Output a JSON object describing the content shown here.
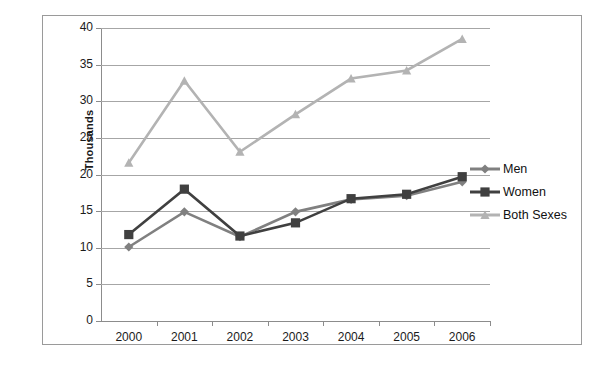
{
  "chart_data": {
    "type": "line",
    "title": "",
    "xlabel": "",
    "ylabel": "Thousands",
    "categories": [
      "2000",
      "2001",
      "2002",
      "2003",
      "2004",
      "2005",
      "2006"
    ],
    "ylim": [
      0,
      40
    ],
    "y_ticks": [
      "0",
      "5",
      "10",
      "15",
      "20",
      "25",
      "30",
      "35",
      "40"
    ],
    "grid": true,
    "legend_position": "right",
    "series": [
      {
        "name": "Men",
        "color": "#808080",
        "marker": "diamond",
        "values": [
          10.1,
          14.9,
          11.5,
          14.9,
          16.6,
          17.1,
          19.0
        ]
      },
      {
        "name": "Women",
        "color": "#404040",
        "marker": "square",
        "values": [
          11.8,
          18.0,
          11.6,
          13.4,
          16.7,
          17.3,
          19.7
        ]
      },
      {
        "name": "Both Sexes",
        "color": "#b3b3b3",
        "marker": "triangle",
        "values": [
          21.6,
          32.8,
          23.1,
          28.2,
          33.1,
          34.2,
          38.5
        ]
      }
    ]
  },
  "legend": {
    "entries": [
      {
        "label": "Men"
      },
      {
        "label": "Women"
      },
      {
        "label": "Both Sexes"
      }
    ]
  },
  "axis": {
    "y_title": "Thousands"
  }
}
